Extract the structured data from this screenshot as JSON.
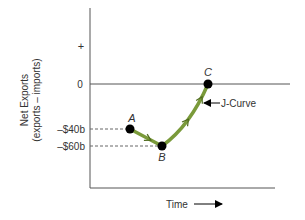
{
  "chart_data": {
    "type": "line",
    "title": "",
    "xlabel": "Time",
    "ylabel_line1": "Net Exports",
    "ylabel_line2": "(exports – imports)",
    "y_tick_labels": [
      {
        "label": "+",
        "value": 40
      },
      {
        "label": "0",
        "value": 0
      },
      {
        "label": "–$40b",
        "value": -40
      },
      {
        "label": "–$60b",
        "value": -60
      }
    ],
    "ylim": [
      -110,
      95
    ],
    "xlim": [
      0,
      10
    ],
    "zero_line": true,
    "points": [
      {
        "label": "A",
        "x": 2,
        "y": -40
      },
      {
        "label": "B",
        "x": 3.6,
        "y": -60
      },
      {
        "label": "C",
        "x": 5.9,
        "y": 0
      }
    ],
    "curve_annotation": "J-Curve",
    "colors": {
      "curve": "#7a9a3a",
      "axis": "#555555",
      "point": "#000000"
    }
  }
}
